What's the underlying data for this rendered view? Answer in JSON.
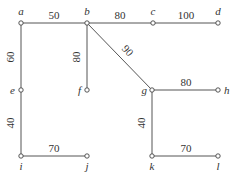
{
  "diagram": {
    "type": "weighted-graph",
    "nodes": [
      {
        "id": "a",
        "label": "a"
      },
      {
        "id": "b",
        "label": "b"
      },
      {
        "id": "c",
        "label": "c"
      },
      {
        "id": "d",
        "label": "d"
      },
      {
        "id": "e",
        "label": "e"
      },
      {
        "id": "f",
        "label": "f"
      },
      {
        "id": "g",
        "label": "g"
      },
      {
        "id": "h",
        "label": "h"
      },
      {
        "id": "i",
        "label": "i"
      },
      {
        "id": "j",
        "label": "j"
      },
      {
        "id": "k",
        "label": "k"
      },
      {
        "id": "l",
        "label": "l"
      }
    ],
    "edges": [
      {
        "from": "a",
        "to": "b",
        "weight": "50"
      },
      {
        "from": "b",
        "to": "c",
        "weight": "80"
      },
      {
        "from": "c",
        "to": "d",
        "weight": "100"
      },
      {
        "from": "a",
        "to": "e",
        "weight": "60"
      },
      {
        "from": "b",
        "to": "f",
        "weight": "80"
      },
      {
        "from": "b",
        "to": "g",
        "weight": "90"
      },
      {
        "from": "g",
        "to": "h",
        "weight": "80"
      },
      {
        "from": "e",
        "to": "i",
        "weight": "40"
      },
      {
        "from": "i",
        "to": "j",
        "weight": "70"
      },
      {
        "from": "g",
        "to": "k",
        "weight": "40"
      },
      {
        "from": "k",
        "to": "l",
        "weight": "70"
      }
    ]
  }
}
